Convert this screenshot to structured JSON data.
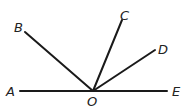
{
  "diagram": {
    "type": "geometry-rays",
    "vertex": {
      "label": "O",
      "x": 93,
      "y": 91
    },
    "points": [
      {
        "label": "A",
        "x": 20,
        "y": 91,
        "lx": 6,
        "ly": 96
      },
      {
        "label": "B",
        "x": 25,
        "y": 32,
        "lx": 14,
        "ly": 32
      },
      {
        "label": "C",
        "x": 122,
        "y": 20,
        "lx": 120,
        "ly": 20
      },
      {
        "label": "D",
        "x": 155,
        "y": 50,
        "lx": 158,
        "ly": 54
      },
      {
        "label": "E",
        "x": 167,
        "y": 91,
        "lx": 172,
        "ly": 96
      }
    ],
    "vertex_label_pos": {
      "x": 87,
      "y": 106
    },
    "line_color": "#1a1a1a"
  }
}
